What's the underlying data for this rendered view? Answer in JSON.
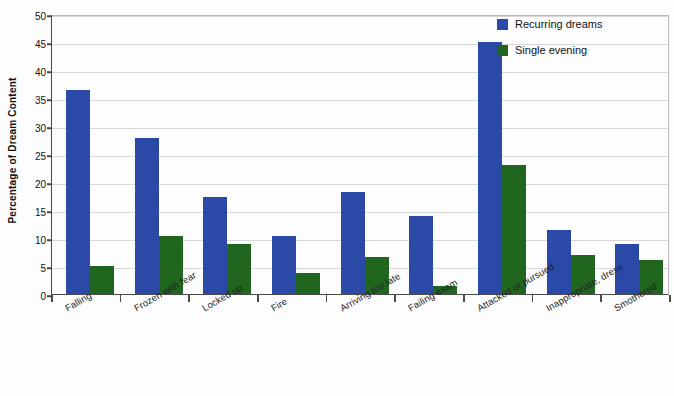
{
  "chart_data": {
    "type": "bar",
    "title": "",
    "subtitle": "",
    "xlabel": "",
    "ylabel": "Percentage of Dream Content",
    "ylim": [
      0,
      50
    ],
    "yticks": [
      0,
      5,
      10,
      15,
      20,
      25,
      30,
      35,
      40,
      45,
      50
    ],
    "grid": true,
    "legend_position": "top-right",
    "categories": [
      "Falling",
      "Frozen with fear",
      "Locked up",
      "Fire",
      "Arriving too late",
      "Failing exam",
      "Attacked or pursued",
      "Inappropriate, dress",
      "Smothered"
    ],
    "series": [
      {
        "name": "Recurring dreams",
        "color": "#2B49A6",
        "values": [
          36.5,
          27.8,
          17.4,
          10.4,
          18.3,
          14.0,
          45.0,
          11.4,
          9.0
        ]
      },
      {
        "name": "Single evening",
        "color": "#20661F",
        "values": [
          5.0,
          10.3,
          9.0,
          3.7,
          6.6,
          1.4,
          23.0,
          6.9,
          6.0
        ]
      }
    ]
  },
  "legend": {
    "items": [
      {
        "label": "Recurring dreams",
        "swatch_name": "legend-swatch-recurring"
      },
      {
        "label": "Single evening",
        "swatch_name": "legend-swatch-single"
      }
    ]
  },
  "colors": {
    "series_recurring": "#2B49A6",
    "series_single": "#20661F",
    "axis": "#4a4a4a",
    "gridline": "#d8d8d8",
    "background": "#fdfdfd",
    "text": "#111111"
  }
}
